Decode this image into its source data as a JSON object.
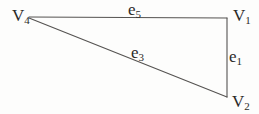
{
  "figure": {
    "background_color": "#fdfdfc",
    "line_color": "#555351",
    "text_color": "#2b2a28",
    "vertices": [
      {
        "name": "V4",
        "base": "V",
        "subscript": "4",
        "position": "top-left"
      },
      {
        "name": "V1",
        "base": "V",
        "subscript": "1",
        "position": "top-right"
      },
      {
        "name": "V2",
        "base": "V",
        "subscript": "2",
        "position": "bottom-right"
      }
    ],
    "edges": [
      {
        "name": "e5",
        "base": "e",
        "subscript": "5",
        "connects": "V4-V1"
      },
      {
        "name": "e1",
        "base": "e",
        "subscript": "1",
        "connects": "V1-V2"
      },
      {
        "name": "e3",
        "base": "e",
        "subscript": "3",
        "connects": "V4-V2"
      }
    ]
  }
}
